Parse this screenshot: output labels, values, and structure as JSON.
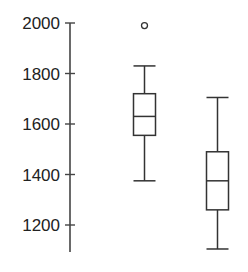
{
  "chart_data": {
    "type": "box",
    "title": "",
    "xlabel": "",
    "ylabel": "",
    "ylim": [
      1100,
      2000
    ],
    "yticks": [
      1200,
      1400,
      1600,
      1800,
      2000
    ],
    "ytick_labels": [
      "1200",
      "1400",
      "1600",
      "1800",
      "2000"
    ],
    "grid": false,
    "legend": null,
    "categories": [
      "",
      ""
    ],
    "series": [
      {
        "name": "Group 1",
        "whisker_low": 1375,
        "q1": 1555,
        "median": 1630,
        "q3": 1720,
        "whisker_high": 1830,
        "outliers": [
          1990
        ]
      },
      {
        "name": "Group 2",
        "whisker_low": 1105,
        "q1": 1260,
        "median": 1375,
        "q3": 1490,
        "whisker_high": 1705,
        "outliers": []
      }
    ]
  },
  "style": {
    "line_color": "#333333",
    "axis_color": "#444444"
  }
}
